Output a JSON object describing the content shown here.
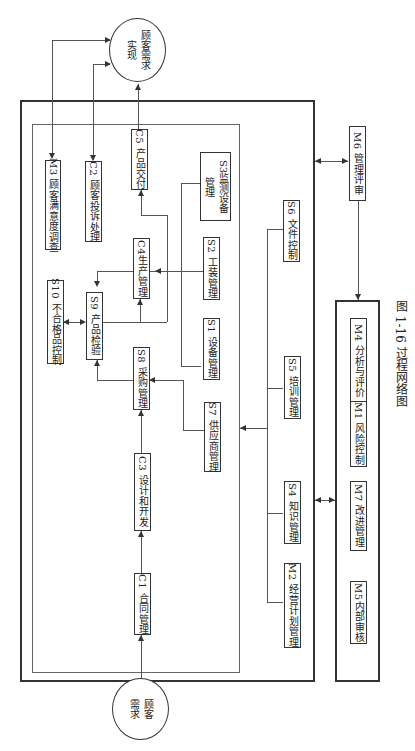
{
  "diagram": {
    "caption": "图 1-16   过程网络图",
    "start_node": "顾客需求",
    "end_node": "顾客需求实现",
    "nodes": {
      "C1": "C1 合同管理",
      "C2": "C2 顾客投诉处理",
      "C3": "C3 设计和开发",
      "C4": "C4生产管理",
      "C5": "C5 产品交付",
      "S1": "S1 设备管理",
      "S2": "S2 工装管理",
      "S3": "S3监测设备管理",
      "S4": "S4 知识管理",
      "S5": "S5 培训管理",
      "S6": "S6 文件控制",
      "S7": "S7 供应商管理",
      "S8": "S8 采购管理",
      "S9": "S9 产品检验",
      "S10": "S10 不合格品控制",
      "M1": "M1 风险控制",
      "M2": "M2 经营计划管理",
      "M3": "M3 顾客满意度调查",
      "M4": "M4 分析与评价",
      "M5": "M5内部审核",
      "M6": "M6 管理评审",
      "M7": "M7 改进管理"
    },
    "edges": [
      [
        "顾客需求",
        "C1"
      ],
      [
        "C1",
        "C3"
      ],
      [
        "C3",
        "S8"
      ],
      [
        "S7",
        "S8"
      ],
      [
        "S8",
        "S9"
      ],
      [
        "S9",
        "C4"
      ],
      [
        "S1",
        "C4"
      ],
      [
        "S2",
        "C4"
      ],
      [
        "C4",
        "S9"
      ],
      [
        "S10",
        "S9"
      ],
      [
        "C4",
        "C5"
      ],
      [
        "S3",
        "C5"
      ],
      [
        "C5",
        "顾客需求实现"
      ],
      [
        "C2",
        "顾客需求实现"
      ],
      [
        "M3",
        "顾客需求实现"
      ],
      [
        "S4",
        "inner"
      ],
      [
        "S5",
        "inner"
      ],
      [
        "S6",
        "inner"
      ],
      [
        "M2",
        "inner"
      ],
      [
        "outer",
        "M6"
      ],
      [
        "M6",
        "M-group"
      ],
      [
        "outer",
        "M-group"
      ]
    ]
  }
}
